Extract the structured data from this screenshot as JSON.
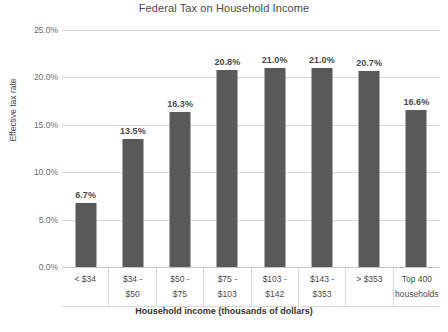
{
  "chart_data": {
    "type": "bar",
    "title": "Federal Tax on Household Income",
    "xlabel": "Household income (thousands of dollars)",
    "ylabel": "Effective tax rate",
    "ylim": [
      0,
      25
    ],
    "ytick_labels": [
      "25.0%",
      "20.0%",
      "15.0%",
      "10.0%",
      "5.0%",
      "0.0%"
    ],
    "ytick_values": [
      25,
      20,
      15,
      10,
      5,
      0
    ],
    "grid": true,
    "legend": "none",
    "bar_color": "#595959",
    "gridline_color": "#d9d9d9",
    "categories": [
      "< $34",
      "$34 - $50",
      "$50 - $75",
      "$75 - $103",
      "$103 - $142",
      "$143 - $353",
      "> $353",
      "Top 400 households"
    ],
    "category_lines": [
      [
        "< $34",
        ""
      ],
      [
        "$34 -",
        "$50"
      ],
      [
        "$50 -",
        "$75"
      ],
      [
        "$75 -",
        "$103"
      ],
      [
        "$103 -",
        "$142"
      ],
      [
        "$143 -",
        "$353"
      ],
      [
        "> $353",
        ""
      ],
      [
        "Top 400",
        "households"
      ]
    ],
    "values": [
      6.7,
      13.5,
      16.3,
      20.8,
      21.0,
      21.0,
      20.7,
      16.6
    ],
    "value_labels": [
      "6.7%",
      "13.5%",
      "16.3%",
      "20.8%",
      "21.0%",
      "21.0%",
      "20.7%",
      "16.6%"
    ]
  }
}
